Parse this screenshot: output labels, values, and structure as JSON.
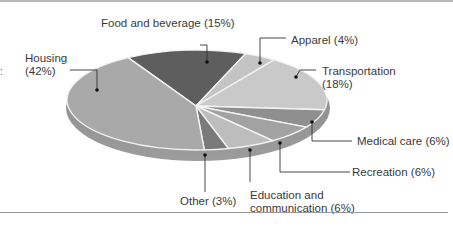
{
  "chart_data": {
    "type": "pie",
    "title": "",
    "style": "3d-tilted",
    "slices": [
      {
        "label": "Food and beverage",
        "value": 15,
        "display": "Food and beverage (15%)",
        "color": "#5e5e5e"
      },
      {
        "label": "Apparel",
        "value": 4,
        "display": "Apparel (4%)",
        "color": "#c4c4c4"
      },
      {
        "label": "Transportation",
        "value": 18,
        "display": "Transportation (18%)",
        "color": "#c9c9c9"
      },
      {
        "label": "Medical care",
        "value": 6,
        "display": "Medical care (6%)",
        "color": "#8f8f8f"
      },
      {
        "label": "Recreation",
        "value": 6,
        "display": "Recreation (6%)",
        "color": "#a2a2a2"
      },
      {
        "label": "Education and communication",
        "value": 6,
        "display": "Education and communication (6%)",
        "color": "#bdbdbd"
      },
      {
        "label": "Other",
        "value": 3,
        "display": "Other (3%)",
        "color": "#7a7a7a"
      },
      {
        "label": "Housing",
        "value": 42,
        "display": "Housing (42%)",
        "color": "#a9a9a9"
      }
    ],
    "legend": "callout-labels"
  },
  "labels": {
    "food": "Food and beverage (15%)",
    "housing_1": "Housing",
    "housing_2": "(42%)",
    "apparel": "Apparel (4%)",
    "transport_1": "Transportation",
    "transport_2": "(18%)",
    "medical": "Medical care (6%)",
    "recreation": "Recreation (6%)",
    "education_1": "Education and",
    "education_2": "communication (6%)",
    "other": "Other (3%)"
  },
  "left_mark": ":"
}
